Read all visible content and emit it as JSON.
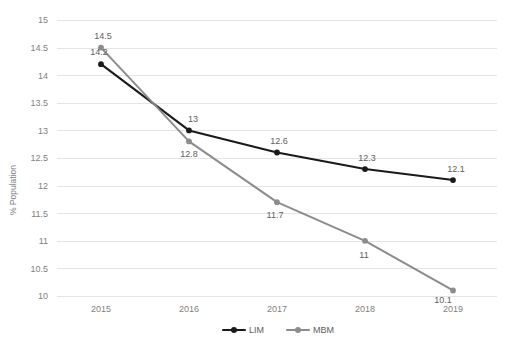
{
  "chart_data": {
    "type": "line",
    "title": "",
    "subtitle": "",
    "xlabel": "",
    "ylabel": "% Population",
    "categories": [
      "2015",
      "2016",
      "2017",
      "2018",
      "2019"
    ],
    "x": [
      2015,
      2016,
      2017,
      2018,
      2019
    ],
    "ylim": [
      10,
      15
    ],
    "yticks": [
      "10",
      "10.5",
      "11",
      "11.5",
      "12",
      "12.5",
      "13",
      "13.5",
      "14",
      "14.5",
      "15"
    ],
    "ytick_values": [
      10,
      10.5,
      11,
      11.5,
      12,
      12.5,
      13,
      13.5,
      14,
      14.5,
      15
    ],
    "grid": "horizontal",
    "legend_position": "bottom",
    "series": [
      {
        "name": "LIM",
        "color": "#1a1a1a",
        "values": [
          14.2,
          13,
          12.6,
          12.3,
          12.1
        ],
        "labels": [
          "14.2",
          "13",
          "12.6",
          "12.3",
          "12.1"
        ]
      },
      {
        "name": "MBM",
        "color": "#8c8c8c",
        "values": [
          14.5,
          12.8,
          11.7,
          11,
          10.1
        ],
        "labels": [
          "14.5",
          "12.8",
          "11.7",
          "11",
          "10.1"
        ]
      }
    ]
  },
  "legend": {
    "items": [
      {
        "label": "LIM",
        "color": "#1a1a1a"
      },
      {
        "label": "MBM",
        "color": "#8c8c8c"
      }
    ]
  },
  "axes": {
    "y_title": "% Population"
  },
  "colors": {
    "gridline": "#e4e4e4",
    "tick_text": "#7f7f7f",
    "label_text": "#606060",
    "series_lim": "#1a1a1a",
    "series_mbm": "#8c8c8c",
    "background": "#ffffff"
  }
}
